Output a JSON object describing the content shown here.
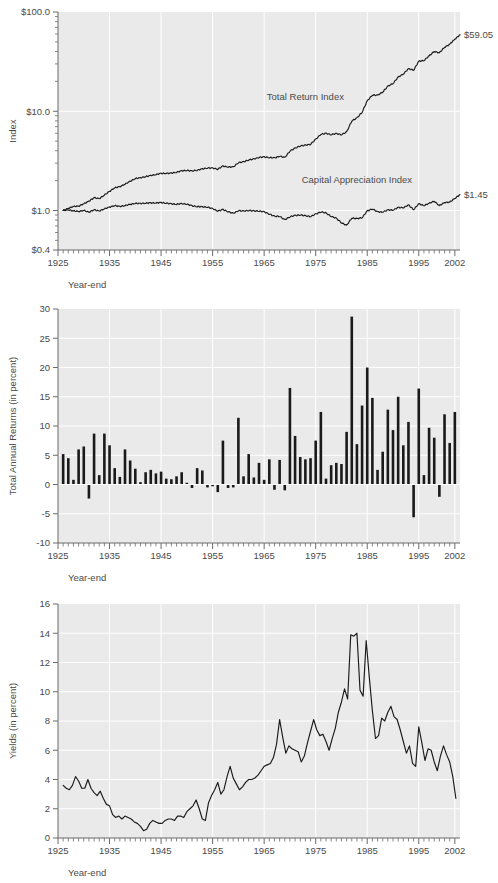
{
  "figure": {
    "xaxis_caption": "Year-end",
    "x_tick_labels": [
      "1925",
      "1935",
      "1945",
      "1955",
      "1965",
      "1975",
      "1985",
      "1995",
      "2002"
    ],
    "x_tick_values": [
      1925,
      1935,
      1945,
      1955,
      1965,
      1975,
      1985,
      1995,
      2002
    ],
    "x_range": [
      1925,
      2003
    ],
    "plot_bg_color": "#eaeaea",
    "grid_color": "#ffffff",
    "series_color": "#1a1a1a",
    "text_color": "#4a4a4a"
  },
  "chart_data": [
    {
      "id": "index",
      "type": "line",
      "title": "",
      "xlabel": "Year-end",
      "ylabel": "Index",
      "yscale": "log",
      "ylim": [
        0.4,
        100.0
      ],
      "y_tick_labels": [
        "$100.0",
        "$10.0",
        "$1.0",
        "$0.4"
      ],
      "y_tick_values": [
        100.0,
        10.0,
        1.0,
        0.4
      ],
      "grid": true,
      "legend_position": "inline-annotation",
      "annotations": [
        {
          "text": "Total Return Index",
          "x": 1973,
          "y": 13.0
        },
        {
          "text": "Capital Appreciation Index",
          "x": 1983,
          "y": 1.9
        }
      ],
      "endpoint_labels": [
        {
          "series": "Total Return Index",
          "text": "$59.05",
          "value": 59.05
        },
        {
          "series": "Capital Appreciation Index",
          "text": "$1.45",
          "value": 1.45
        }
      ],
      "x": [
        1926,
        1927,
        1928,
        1929,
        1930,
        1931,
        1932,
        1933,
        1934,
        1935,
        1936,
        1937,
        1938,
        1939,
        1940,
        1941,
        1942,
        1943,
        1944,
        1945,
        1946,
        1947,
        1948,
        1949,
        1950,
        1951,
        1952,
        1953,
        1954,
        1955,
        1956,
        1957,
        1958,
        1959,
        1960,
        1961,
        1962,
        1963,
        1964,
        1965,
        1966,
        1967,
        1968,
        1969,
        1970,
        1971,
        1972,
        1973,
        1974,
        1975,
        1976,
        1977,
        1978,
        1979,
        1980,
        1981,
        1982,
        1983,
        1984,
        1985,
        1986,
        1987,
        1988,
        1989,
        1990,
        1991,
        1992,
        1993,
        1994,
        1995,
        1996,
        1997,
        1998,
        1999,
        2000,
        2001,
        2002
      ],
      "series": [
        {
          "name": "Total Return Index",
          "values": [
            1.0,
            1.052,
            1.099,
            1.105,
            1.171,
            1.24,
            1.348,
            1.315,
            1.432,
            1.557,
            1.693,
            1.738,
            1.844,
            1.967,
            2.1,
            2.133,
            2.197,
            2.25,
            2.306,
            2.363,
            2.372,
            2.377,
            2.434,
            2.506,
            2.54,
            2.497,
            2.555,
            2.616,
            2.69,
            2.667,
            2.617,
            2.793,
            2.755,
            2.737,
            3.043,
            3.085,
            3.243,
            3.292,
            3.441,
            3.458,
            3.426,
            3.376,
            3.541,
            3.405,
            3.982,
            4.237,
            4.484,
            4.529,
            4.665,
            5.198,
            5.882,
            5.966,
            5.833,
            5.945,
            5.816,
            6.173,
            7.99,
            8.542,
            9.776,
            12.691,
            14.597,
            14.48,
            15.624,
            17.862,
            19.053,
            22.03,
            23.735,
            26.803,
            25.953,
            31.866,
            32.413,
            36.118,
            40.056,
            38.757,
            44.075,
            47.325,
            53.219
          ],
          "final_value": 59.05
        },
        {
          "name": "Capital Appreciation Index",
          "values": [
            1.0,
            1.015,
            0.992,
            0.977,
            1.003,
            0.96,
            1.018,
            0.987,
            1.04,
            1.082,
            1.12,
            1.097,
            1.122,
            1.151,
            1.182,
            1.176,
            1.186,
            1.191,
            1.194,
            1.2,
            1.187,
            1.164,
            1.159,
            1.169,
            1.163,
            1.112,
            1.098,
            1.086,
            1.085,
            1.04,
            0.99,
            1.019,
            0.976,
            0.933,
            0.999,
            0.984,
            1.005,
            0.987,
            0.991,
            0.966,
            0.924,
            0.872,
            0.877,
            0.804,
            0.868,
            0.888,
            0.905,
            0.882,
            0.872,
            0.918,
            0.972,
            0.941,
            0.874,
            0.833,
            0.754,
            0.706,
            0.84,
            0.826,
            0.847,
            0.989,
            1.038,
            0.969,
            0.966,
            1.013,
            1.01,
            1.072,
            1.068,
            1.137,
            1.02,
            1.168,
            1.12,
            1.182,
            1.24,
            1.12,
            1.203,
            1.216,
            1.321
          ],
          "final_value": 1.45
        }
      ]
    },
    {
      "id": "returns",
      "type": "bar",
      "title": "",
      "xlabel": "Year-end",
      "ylabel": "Total Annual Returns (in percent)",
      "ylim": [
        -10,
        30
      ],
      "y_tick_labels": [
        "30",
        "25",
        "20",
        "15",
        "10",
        "5",
        "0",
        "-5",
        "-10"
      ],
      "y_tick_values": [
        30,
        25,
        20,
        15,
        10,
        5,
        0,
        -5,
        -10
      ],
      "grid": true,
      "categories": [
        1926,
        1927,
        1928,
        1929,
        1930,
        1931,
        1932,
        1933,
        1934,
        1935,
        1936,
        1937,
        1938,
        1939,
        1940,
        1941,
        1942,
        1943,
        1944,
        1945,
        1946,
        1947,
        1948,
        1949,
        1950,
        1951,
        1952,
        1953,
        1954,
        1955,
        1956,
        1957,
        1958,
        1959,
        1960,
        1961,
        1962,
        1963,
        1964,
        1965,
        1966,
        1967,
        1968,
        1969,
        1970,
        1971,
        1972,
        1973,
        1974,
        1975,
        1976,
        1977,
        1978,
        1979,
        1980,
        1981,
        1982,
        1983,
        1984,
        1985,
        1986,
        1987,
        1988,
        1989,
        1990,
        1991,
        1992,
        1993,
        1994,
        1995,
        1996,
        1997,
        1998,
        1999,
        2000,
        2001,
        2002
      ],
      "values": [
        5.2,
        4.5,
        0.8,
        6.0,
        6.5,
        -2.4,
        8.7,
        1.6,
        8.7,
        6.7,
        2.8,
        1.3,
        6.0,
        4.1,
        2.7,
        0.4,
        2.1,
        2.5,
        1.9,
        2.2,
        1.0,
        0.9,
        1.4,
        2.1,
        0.3,
        -0.6,
        2.8,
        2.4,
        -0.5,
        -0.3,
        -1.3,
        7.5,
        -0.6,
        -0.5,
        11.4,
        1.4,
        5.2,
        1.2,
        3.7,
        0.8,
        4.3,
        -0.9,
        4.2,
        -1.0,
        16.5,
        8.3,
        4.7,
        4.3,
        4.5,
        7.5,
        12.4,
        1.0,
        3.3,
        3.7,
        3.5,
        9.0,
        28.7,
        6.9,
        13.5,
        20.0,
        14.8,
        2.5,
        5.6,
        12.8,
        9.3,
        15.0,
        6.7,
        10.7,
        -5.6,
        16.4,
        1.6,
        9.7,
        8.0,
        -2.1,
        12.0,
        7.1,
        12.4
      ]
    },
    {
      "id": "yields",
      "type": "line",
      "title": "",
      "xlabel": "Year-end",
      "ylabel": "Yields (in percent)",
      "ylim": [
        0,
        16
      ],
      "y_tick_labels": [
        "16",
        "14",
        "12",
        "10",
        "8",
        "6",
        "4",
        "2",
        "0"
      ],
      "y_tick_values": [
        16,
        14,
        12,
        10,
        8,
        6,
        4,
        2,
        0
      ],
      "grid": true,
      "x": [
        1926.0,
        1926.6,
        1927.2,
        1927.8,
        1928.4,
        1929.0,
        1929.6,
        1930.2,
        1930.8,
        1931.4,
        1932.0,
        1932.6,
        1933.2,
        1933.8,
        1934.4,
        1935.0,
        1935.6,
        1936.2,
        1936.8,
        1937.4,
        1938.0,
        1938.6,
        1939.2,
        1939.8,
        1940.4,
        1941.0,
        1941.6,
        1942.2,
        1942.8,
        1943.4,
        1944.0,
        1944.6,
        1945.2,
        1945.8,
        1946.4,
        1947.0,
        1947.6,
        1948.2,
        1948.8,
        1949.4,
        1950.0,
        1950.6,
        1951.2,
        1951.8,
        1952.4,
        1953.0,
        1953.6,
        1954.2,
        1954.8,
        1955.4,
        1956.0,
        1956.6,
        1957.2,
        1957.8,
        1958.4,
        1959.0,
        1959.6,
        1960.2,
        1960.8,
        1961.4,
        1962.0,
        1962.6,
        1963.2,
        1963.8,
        1964.4,
        1965.0,
        1965.6,
        1966.2,
        1966.8,
        1967.4,
        1968.0,
        1968.6,
        1969.2,
        1969.8,
        1970.4,
        1971.0,
        1971.6,
        1972.2,
        1972.8,
        1973.4,
        1974.0,
        1974.6,
        1975.2,
        1975.8,
        1976.4,
        1977.0,
        1977.6,
        1978.2,
        1978.8,
        1979.4,
        1980.0,
        1980.6,
        1981.2,
        1981.8,
        1982.4,
        1983.0,
        1983.6,
        1984.2,
        1984.8,
        1985.4,
        1986.0,
        1986.6,
        1987.2,
        1987.8,
        1988.4,
        1989.0,
        1989.6,
        1990.2,
        1990.8,
        1991.4,
        1992.0,
        1992.6,
        1993.2,
        1993.8,
        1994.4,
        1995.0,
        1995.6,
        1996.2,
        1996.8,
        1997.4,
        1998.0,
        1998.6,
        1999.2,
        1999.8,
        2000.4,
        2001.0,
        2001.6,
        2002.2,
        2002.8
      ],
      "values": [
        3.6,
        3.4,
        3.3,
        3.6,
        4.2,
        3.9,
        3.4,
        3.4,
        4.0,
        3.4,
        3.1,
        2.9,
        3.2,
        2.7,
        2.3,
        2.2,
        1.6,
        1.4,
        1.5,
        1.3,
        1.5,
        1.4,
        1.3,
        1.1,
        1.0,
        0.8,
        0.5,
        0.6,
        1.0,
        1.2,
        1.1,
        1.0,
        1.0,
        1.2,
        1.3,
        1.3,
        1.2,
        1.5,
        1.5,
        1.4,
        1.8,
        2.0,
        2.2,
        2.6,
        2.0,
        1.3,
        1.2,
        2.4,
        2.9,
        3.3,
        3.8,
        3.0,
        3.3,
        4.2,
        4.9,
        4.1,
        3.7,
        3.3,
        3.5,
        3.8,
        4.0,
        4.0,
        4.1,
        4.3,
        4.6,
        4.9,
        5.0,
        5.1,
        5.5,
        6.4,
        8.1,
        6.9,
        5.8,
        6.3,
        6.1,
        6.0,
        5.9,
        5.2,
        5.6,
        6.5,
        7.3,
        8.1,
        7.4,
        7.0,
        7.1,
        6.6,
        6.0,
        6.8,
        7.5,
        8.6,
        9.3,
        10.2,
        9.5,
        13.9,
        13.8,
        14.0,
        10.1,
        9.7,
        13.5,
        11.0,
        8.7,
        6.8,
        7.0,
        8.2,
        8.0,
        8.6,
        9.0,
        8.3,
        8.1,
        7.4,
        6.6,
        5.8,
        6.3,
        5.1,
        4.9,
        7.6,
        6.5,
        5.3,
        6.1,
        6.0,
        5.2,
        4.6,
        5.6,
        6.3,
        5.7,
        5.2,
        4.2,
        2.7
      ]
    }
  ]
}
